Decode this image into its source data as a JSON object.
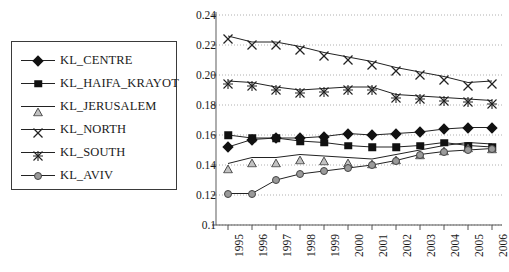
{
  "chart_data": {
    "type": "line",
    "title": "",
    "xlabel": "",
    "ylabel": "",
    "categories": [
      "1995",
      "1996",
      "1997",
      "1998",
      "1999",
      "2000",
      "2001",
      "2002",
      "2003",
      "2004",
      "2005",
      "2006"
    ],
    "ylim": [
      0.1,
      0.24
    ],
    "ytick_labels": [
      "0.24",
      "0.22",
      "0.20",
      "0.18",
      "0.16",
      "0.14",
      "0.12",
      "0.1"
    ],
    "ytick_values": [
      0.24,
      0.22,
      0.2,
      0.18,
      0.16,
      0.14,
      0.12,
      0.1
    ],
    "ytick_step": 0.02,
    "grid": true,
    "legend_position": "left-outside",
    "series": [
      {
        "name": "KL_CENTRE",
        "marker": "diamond",
        "color": "#111111",
        "values": [
          0.152,
          0.157,
          0.158,
          0.158,
          0.159,
          0.161,
          0.16,
          0.161,
          0.162,
          0.164,
          0.165,
          0.165
        ]
      },
      {
        "name": "KL_HAIFA_KRAYOT",
        "marker": "square",
        "color": "#111111",
        "values": [
          0.16,
          0.158,
          0.158,
          0.156,
          0.155,
          0.153,
          0.152,
          0.152,
          0.153,
          0.155,
          0.153,
          0.152
        ]
      },
      {
        "name": "KL_JERUSALEM",
        "marker": "triangle",
        "color": "#b9b9b9",
        "values": [
          0.141,
          0.145,
          0.145,
          0.147,
          0.146,
          0.145,
          0.144,
          0.147,
          0.15,
          0.153,
          0.155,
          0.154
        ]
      },
      {
        "name": "KL_NORTH",
        "marker": "x",
        "color": "#333333",
        "values": [
          0.226,
          0.222,
          0.222,
          0.219,
          0.215,
          0.212,
          0.209,
          0.205,
          0.202,
          0.199,
          0.195,
          0.196
        ]
      },
      {
        "name": "KL_SOUTH",
        "marker": "star",
        "color": "#333333",
        "values": [
          0.196,
          0.195,
          0.192,
          0.19,
          0.191,
          0.192,
          0.192,
          0.187,
          0.186,
          0.185,
          0.184,
          0.183
        ]
      },
      {
        "name": "KL_AVIV",
        "marker": "circle",
        "color": "#9a9a9a",
        "values": [
          0.121,
          0.121,
          0.13,
          0.134,
          0.136,
          0.138,
          0.14,
          0.143,
          0.147,
          0.149,
          0.15,
          0.151
        ]
      }
    ]
  },
  "legend": {
    "items": [
      {
        "label": "KL_CENTRE",
        "marker": "diamond"
      },
      {
        "label": "KL_HAIFA_KRAYOT",
        "marker": "square"
      },
      {
        "label": "KL_JERUSALEM",
        "marker": "triangle"
      },
      {
        "label": "KL_NORTH",
        "marker": "x"
      },
      {
        "label": "KL_SOUTH",
        "marker": "star"
      },
      {
        "label": "KL_AVIV",
        "marker": "circle"
      }
    ]
  },
  "caption": ""
}
